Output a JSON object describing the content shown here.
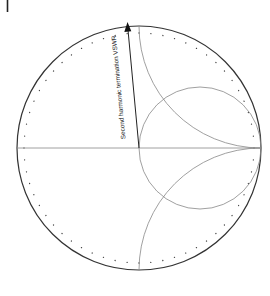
{
  "diagram": {
    "type": "smith-chart",
    "annotation": {
      "label": "Second harmonic termination VSWR",
      "arrow_direction": "up"
    },
    "colors": {
      "outer_circle": "#333333",
      "dots": "#444444",
      "construction_lines": "#888888",
      "arrow": "#222222",
      "background": "#ffffff"
    },
    "elements": [
      "outer-boundary-circle",
      "dotted-vswr-circle",
      "real-axis",
      "unit-resistance-circle",
      "positive-unit-reactance-arc",
      "negative-unit-reactance-arc",
      "vswr-arrow"
    ]
  }
}
